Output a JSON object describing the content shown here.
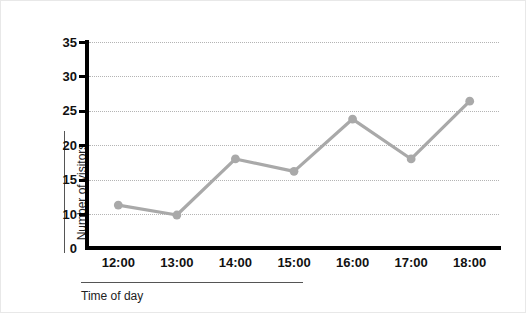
{
  "chart_data": {
    "type": "line",
    "title": "",
    "xlabel": "Time of day",
    "ylabel": "Number of visitors",
    "categories": [
      "12:00",
      "13:00",
      "14:00",
      "15:00",
      "16:00",
      "17:00",
      "18:00"
    ],
    "values": [
      11.3,
      9.7,
      18.0,
      16.2,
      23.8,
      18.0,
      26.4
    ],
    "series": [
      {
        "name": "Number of visitors",
        "values": [
          11.3,
          9.7,
          18.0,
          16.2,
          23.8,
          18.0,
          26.4
        ]
      }
    ],
    "ylim": [
      0,
      35
    ],
    "y_ticks": [
      0,
      10,
      15,
      20,
      25,
      30,
      35
    ],
    "y_tick_labels": [
      "0",
      "10",
      "15",
      "20",
      "25",
      "30",
      "35"
    ],
    "x_tick_labels": [
      "12:00",
      "13:00",
      "14:00",
      "15:00",
      "16:00",
      "17:00",
      "18:00"
    ],
    "grid": true,
    "grid_values": [
      10,
      15,
      20,
      25,
      30,
      35
    ],
    "legend": "none",
    "line_color": "#a9a9a9",
    "marker_color": "#a9a9a9",
    "grid_color": "#b4b4b4",
    "axis_color": "#000000",
    "background_color": "#ffffff",
    "marker": "circle",
    "axis_break": true
  }
}
